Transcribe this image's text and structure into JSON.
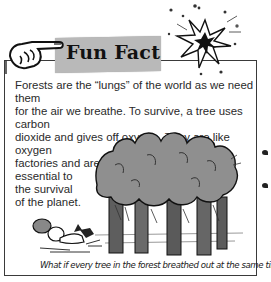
{
  "header": {
    "title": "Fun Fact",
    "icons": [
      "pointing-hand-icon",
      "starburst-icon"
    ]
  },
  "body": {
    "lines": [
      "Forests are the “lungs” of the world as we need them",
      "for the air we breathe. To survive, a tree uses carbon",
      "dioxide and gives off oxygen. They are like oxygen",
      "factories and are",
      "essential to",
      "the survival",
      "of the planet."
    ]
  },
  "illustration": {
    "subject": "forest-trees-breathing-out",
    "caption": "What if every tree in the forest breathed out at the same time!"
  },
  "colors": {
    "banner": "#b9b9b9",
    "tree_canopy": "#8f8f8f",
    "trunk": "#555555",
    "border": "#3a3a3a",
    "text": "#2a2a2a"
  }
}
